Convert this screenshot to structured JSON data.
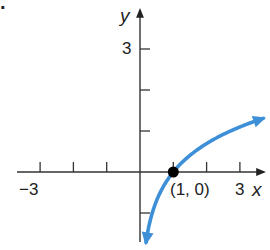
{
  "figure_marker": ".",
  "chart_data": {
    "type": "line",
    "title": "",
    "function": "y = ln x",
    "xlabel": "x",
    "ylabel": "y",
    "xlim": [
      -3.7,
      3.7
    ],
    "ylim": [
      -1.6,
      4.0
    ],
    "x_ticks": [
      -3,
      -2,
      -1,
      1,
      2,
      3
    ],
    "y_ticks": [
      -1,
      1,
      2,
      3
    ],
    "x_tick_labels": [
      {
        "value": -3,
        "label": "−3"
      },
      {
        "value": 3,
        "label": "3"
      }
    ],
    "y_tick_labels": [
      {
        "value": 3,
        "label": "3"
      }
    ],
    "grid": false,
    "series": [
      {
        "name": "y = ln x",
        "color": "#3d8fd8",
        "arrows": "both",
        "x": [
          0.18,
          0.25,
          0.35,
          0.5,
          0.7,
          1.0,
          1.5,
          2.0,
          2.5,
          3.0,
          3.7
        ],
        "values": [
          -1.71,
          -1.39,
          -1.05,
          -0.69,
          -0.36,
          0.0,
          0.41,
          0.69,
          0.92,
          1.1,
          1.31
        ]
      }
    ],
    "annotations": [
      {
        "type": "point",
        "x": 1,
        "y": 0,
        "label": "(1, 0)",
        "color": "#000000"
      }
    ]
  },
  "labels": {
    "x_axis": "x",
    "y_axis": "y",
    "x_neg3": "−3",
    "x_pos3": "3",
    "y_pos3": "3",
    "point": "(1, 0)"
  },
  "colors": {
    "axis": "#333333",
    "curve": "#3d8fd8",
    "point": "#000000"
  }
}
